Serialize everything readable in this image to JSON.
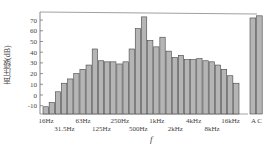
{
  "chart_data": {
    "type": "bar",
    "title": "",
    "xlabel": "f",
    "ylabel": "声压级(dB)",
    "ylim": [
      -15,
      78
    ],
    "yticks": [
      -10,
      0,
      10,
      20,
      30,
      40,
      50,
      60,
      70
    ],
    "grid": false,
    "categories": [
      "16Hz",
      "20Hz",
      "25Hz",
      "31.5Hz",
      "40Hz",
      "50Hz",
      "63Hz",
      "80Hz",
      "100Hz",
      "125Hz",
      "160Hz",
      "200Hz",
      "250Hz",
      "315Hz",
      "400Hz",
      "500Hz",
      "630Hz",
      "800Hz",
      "1kHz",
      "1.25kHz",
      "1.6kHz",
      "2kHz",
      "2.5kHz",
      "3.15kHz",
      "4kHz",
      "5kHz",
      "6.3kHz",
      "8kHz",
      "10kHz",
      "12.5kHz",
      "16kHz",
      "20kHz"
    ],
    "values": [
      -11,
      -7,
      3,
      11,
      15,
      20,
      24,
      28,
      43,
      32,
      31,
      31,
      29,
      31,
      43,
      62,
      73,
      51,
      45,
      54,
      41,
      35,
      37,
      33,
      33,
      34,
      32,
      31,
      28,
      24,
      18,
      11
    ],
    "x_tick_labels_row1": [
      "16Hz",
      "63Hz",
      "250Hz",
      "1kHz",
      "4kHz",
      "16kHz"
    ],
    "x_tick_labels_row2": [
      "31.5Hz",
      "125Hz",
      "500Hz",
      "2kHz",
      "8kHz"
    ],
    "weighted": {
      "categories": [
        "A",
        "C"
      ],
      "values": [
        72,
        74
      ]
    },
    "bar_color": "#b5b5b5",
    "edge_color": "#444444"
  }
}
